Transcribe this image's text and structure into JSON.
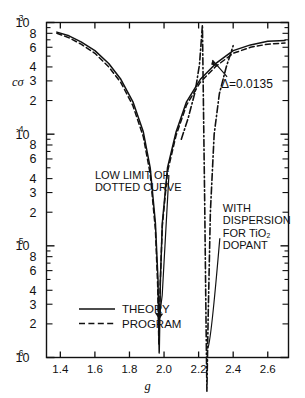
{
  "chart_data": {
    "type": "line",
    "title": "",
    "xlabel": "g",
    "ylabel": "cσ",
    "xlim": [
      1.32,
      2.72
    ],
    "ylim_log": [
      -6,
      -3
    ],
    "x_ticks": [
      1.4,
      1.6,
      1.8,
      2.0,
      2.2,
      2.4,
      2.6
    ],
    "x_tick_labels": [
      "1.4",
      "1.6",
      "1.8",
      "2.0",
      "2.2",
      "2.4",
      "2.6"
    ],
    "y_decade_labels": [
      "10⁻³",
      "10⁻⁴",
      "10⁻⁵",
      "10⁻⁶"
    ],
    "y_decade_exponents": [
      "-3",
      "-4",
      "-5",
      "-6"
    ],
    "y_minor_labels": [
      "8",
      "6",
      "4",
      "3",
      "2"
    ],
    "y_log_scale": "descending",
    "grid": false,
    "legend_position": "lower-left-inside",
    "series": [
      {
        "name": "THEORY",
        "style": "solid",
        "points": [
          [
            1.38,
            0.00082
          ],
          [
            1.45,
            0.00076
          ],
          [
            1.52,
            0.00067
          ],
          [
            1.6,
            0.00056
          ],
          [
            1.68,
            0.00043
          ],
          [
            1.75,
            0.00031
          ],
          [
            1.82,
            0.000195
          ],
          [
            1.88,
            0.000105
          ],
          [
            1.92,
            5e-05
          ],
          [
            1.95,
            1.6e-05
          ],
          [
            1.965,
            5e-06
          ],
          [
            1.972,
            1.1e-06
          ],
          [
            1.979,
            5e-06
          ],
          [
            1.99,
            1.6e-05
          ],
          [
            2.02,
            5e-05
          ],
          [
            2.07,
            0.000105
          ],
          [
            2.13,
            0.000195
          ],
          [
            2.21,
            0.00031
          ],
          [
            2.3,
            0.00043
          ],
          [
            2.4,
            0.00056
          ],
          [
            2.5,
            0.00063
          ],
          [
            2.6,
            0.00068
          ],
          [
            2.7,
            0.00069
          ]
        ]
      },
      {
        "name": "PROGRAM",
        "style": "dashed",
        "points": [
          [
            1.38,
            0.0008
          ],
          [
            1.45,
            0.00073
          ],
          [
            1.52,
            0.00064
          ],
          [
            1.6,
            0.00053
          ],
          [
            1.68,
            0.0004
          ],
          [
            1.75,
            0.00029
          ],
          [
            1.82,
            0.00018
          ],
          [
            1.88,
            9.5e-05
          ],
          [
            1.92,
            4.4e-05
          ],
          [
            1.95,
            1.4e-05
          ],
          [
            1.963,
            4.5e-06
          ],
          [
            1.97,
            1.3e-06
          ],
          [
            1.978,
            4.6e-06
          ],
          [
            1.99,
            1.5e-05
          ],
          [
            2.02,
            4.6e-05
          ],
          [
            2.07,
            9.8e-05
          ],
          [
            2.13,
            0.000182
          ],
          [
            2.21,
            0.000292
          ],
          [
            2.3,
            0.000405
          ],
          [
            2.4,
            0.00053
          ],
          [
            2.5,
            0.0006
          ],
          [
            2.6,
            0.00064
          ],
          [
            2.7,
            0.000655
          ]
        ]
      },
      {
        "name": "WITH DISPERSION FOR TiO2 DOPANT",
        "style": "dash-dot",
        "points": [
          [
            2.1,
            9e-05
          ],
          [
            2.14,
            0.00014
          ],
          [
            2.18,
            0.00024
          ],
          [
            2.205,
            0.00042
          ],
          [
            2.222,
            0.00095
          ],
          [
            2.235,
            2.6e-05
          ],
          [
            2.243,
            2e-06
          ],
          [
            2.248,
            5e-07
          ],
          [
            2.255,
            2.2e-06
          ],
          [
            2.268,
            2e-05
          ],
          [
            2.29,
            0.0001
          ],
          [
            2.32,
            0.00023
          ],
          [
            2.36,
            0.0004
          ],
          [
            2.4,
            0.00062
          ]
        ]
      }
    ],
    "annotations": [
      {
        "id": "delta",
        "text": "Δ=0.0135",
        "x": 2.33,
        "y": 0.00026,
        "arrow_to": [
          2.28,
          0.00046
        ]
      },
      {
        "id": "dispersion",
        "text": "WITH DISPERSION FOR TiO₂ DOPANT",
        "lines": [
          "WITH",
          "DISPERSION",
          "FOR TiO₂",
          "DOPANT"
        ],
        "x": 2.34,
        "y": 2e-05
      },
      {
        "id": "low-limit",
        "text": "LOW LIMIT OF DOTTED CURVE",
        "lines": [
          "LOW LIMIT OF",
          "DOTTED CURVE"
        ],
        "x": 1.6,
        "y": 4e-05,
        "arrow_to": [
          1.972,
          2.2e-06
        ]
      }
    ],
    "legend_entries": [
      {
        "label": "THEORY",
        "style": "solid"
      },
      {
        "label": "PROGRAM",
        "style": "dashed"
      }
    ]
  },
  "axes": {
    "x_axis_label": "g",
    "y_axis_label": "cσ"
  },
  "colors": {
    "ink": "#111111",
    "background": "#ffffff"
  }
}
